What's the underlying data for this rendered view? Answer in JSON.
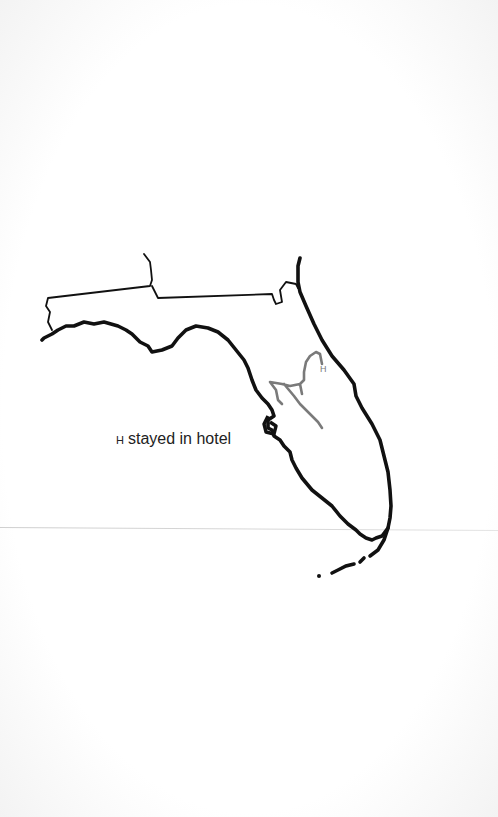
{
  "map": {
    "region": "Florida",
    "outline_color": "#111111",
    "route_color": "#7a7a7a",
    "hotel_marker": "H"
  },
  "legend": {
    "symbol": "H",
    "label": "stayed in hotel"
  }
}
